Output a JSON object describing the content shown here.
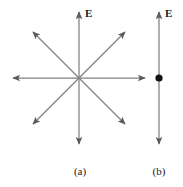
{
  "figure": {
    "width": 183,
    "height": 187,
    "background_color": "#ffffff",
    "line_color": "#808080",
    "arrowhead_color": "#5a5a5a",
    "dot_color": "#101010",
    "text_color": "#1a1a1a"
  },
  "panel_a": {
    "caption": "(a)",
    "field_label": "E",
    "center": {
      "x": 79,
      "y": 78
    },
    "arrow_count": 8,
    "arrows": [
      {
        "name": "up",
        "angle_deg": 90,
        "tip": {
          "x": 79,
          "y": 10
        }
      },
      {
        "name": "up-right",
        "angle_deg": 45,
        "tip": {
          "x": 127,
          "y": 30
        }
      },
      {
        "name": "right",
        "angle_deg": 0,
        "tip": {
          "x": 147,
          "y": 78
        }
      },
      {
        "name": "down-right",
        "angle_deg": -45,
        "tip": {
          "x": 127,
          "y": 126
        }
      },
      {
        "name": "down",
        "angle_deg": -90,
        "tip": {
          "x": 79,
          "y": 146
        }
      },
      {
        "name": "down-left",
        "angle_deg": -135,
        "tip": {
          "x": 31,
          "y": 126
        }
      },
      {
        "name": "left",
        "angle_deg": 180,
        "tip": {
          "x": 11,
          "y": 78
        }
      },
      {
        "name": "up-left",
        "angle_deg": 135,
        "tip": {
          "x": 31,
          "y": 30
        }
      }
    ]
  },
  "panel_b": {
    "caption": "(b)",
    "field_label": "E",
    "axis_x": 159,
    "arrow_top": {
      "x": 159,
      "y": 10
    },
    "arrow_bottom": {
      "x": 159,
      "y": 146
    },
    "point_marker": {
      "x": 159,
      "y": 78,
      "radius": 3.6
    }
  }
}
